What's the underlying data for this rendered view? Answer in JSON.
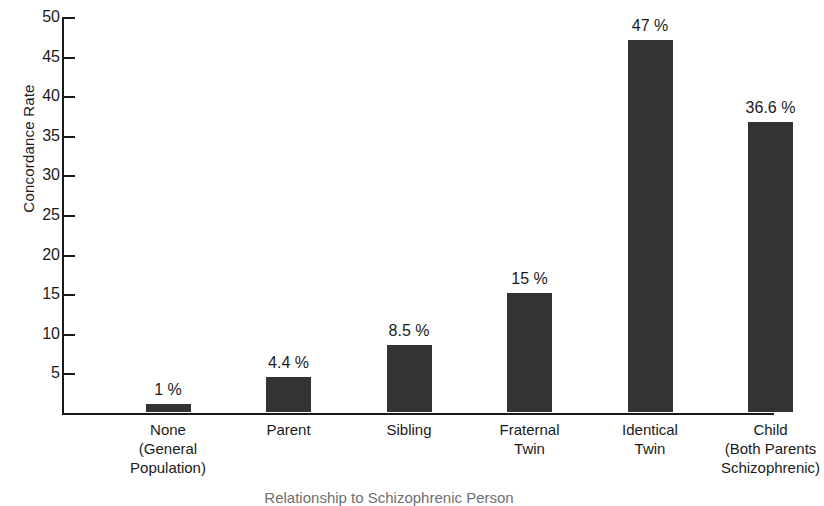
{
  "chart_data": {
    "type": "bar",
    "title": "",
    "xlabel": "Relationship to Schizophrenic Person",
    "ylabel": "Concordance Rate",
    "categories": [
      "None (General Population)",
      "Parent",
      "Sibling",
      "Fraternal Twin",
      "Identical Twin",
      "Child (Both Parents Schizophrenic)"
    ],
    "category_lines": [
      [
        "None",
        "(General",
        "Population)"
      ],
      [
        "Parent"
      ],
      [
        "Sibling"
      ],
      [
        "Fraternal",
        "Twin"
      ],
      [
        "Identical",
        "Twin"
      ],
      [
        "Child",
        "(Both Parents",
        "Schizophrenic)"
      ]
    ],
    "values": [
      1,
      4.4,
      8.5,
      15,
      47,
      36.6
    ],
    "value_labels": [
      "1 %",
      "4.4 %",
      "8.5 %",
      "15 %",
      "47 %",
      "36.6 %"
    ],
    "ylim": [
      0,
      50
    ],
    "yticks": [
      5,
      10,
      15,
      20,
      25,
      30,
      35,
      40,
      45,
      50
    ],
    "ytick_labels": [
      "5",
      "10",
      "15",
      "20",
      "25",
      "30",
      "35",
      "40",
      "45",
      "50"
    ],
    "grid": false,
    "legend": false,
    "bar_color": "#333333",
    "axis_color": "#1a1a1a"
  }
}
